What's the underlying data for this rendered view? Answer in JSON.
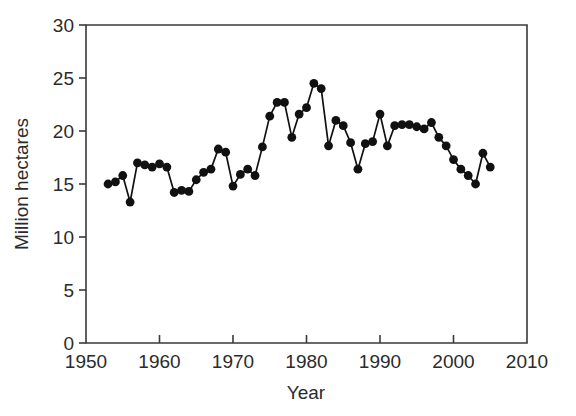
{
  "chart_data": {
    "type": "line",
    "title": "",
    "xlabel": "Year",
    "ylabel": "Million hectares",
    "xlim": [
      1950,
      2010
    ],
    "ylim": [
      0,
      30
    ],
    "xticks": [
      1950,
      1960,
      1970,
      1980,
      1990,
      2000,
      2010
    ],
    "xtick_labels": [
      "1950",
      "1960",
      "1970",
      "1980",
      "1990",
      "2000",
      "2010"
    ],
    "yticks": [
      0,
      5,
      10,
      15,
      20,
      25,
      30
    ],
    "ytick_labels": [
      "0",
      "5",
      "10",
      "15",
      "20",
      "25",
      "30"
    ],
    "grid": false,
    "legend": null,
    "marker": "filled-circle",
    "line_color": "#111111",
    "marker_color": "#111111",
    "axis_color": "#3a3a3a",
    "background": "#ffffff",
    "x": [
      1953,
      1954,
      1955,
      1956,
      1957,
      1958,
      1959,
      1960,
      1961,
      1962,
      1963,
      1964,
      1965,
      1966,
      1967,
      1968,
      1969,
      1970,
      1971,
      1972,
      1973,
      1974,
      1975,
      1976,
      1977,
      1978,
      1979,
      1980,
      1981,
      1982,
      1983,
      1984,
      1985,
      1986,
      1987,
      1988,
      1989,
      1990,
      1991,
      1992,
      1993,
      1994,
      1995,
      1996,
      1997,
      1998,
      1999,
      2000,
      2001,
      2002,
      2003,
      2004
    ],
    "y": [
      15.0,
      15.2,
      15.8,
      13.3,
      17.0,
      16.8,
      16.6,
      16.9,
      16.6,
      14.2,
      14.4,
      14.3,
      15.4,
      16.1,
      16.4,
      18.3,
      18.0,
      14.8,
      15.9,
      16.4,
      15.8,
      18.5,
      21.4,
      22.7,
      22.7,
      19.4,
      21.6,
      22.2,
      24.5,
      24.0,
      18.6,
      21.0,
      20.5,
      18.9,
      16.4,
      18.8,
      19.0,
      21.6,
      18.6,
      20.5,
      20.6,
      20.6,
      20.4,
      20.2,
      20.8,
      19.4,
      18.6,
      17.3,
      16.4,
      15.8,
      15.0,
      17.9,
      16.6
    ],
    "series": [
      {
        "name": "Million hectares",
        "points": [
          [
            1953,
            15.0
          ],
          [
            1954,
            15.2
          ],
          [
            1955,
            15.8
          ],
          [
            1956,
            13.3
          ],
          [
            1957,
            17.0
          ],
          [
            1958,
            16.8
          ],
          [
            1959,
            16.6
          ],
          [
            1960,
            16.9
          ],
          [
            1961,
            16.6
          ],
          [
            1962,
            14.2
          ],
          [
            1963,
            14.4
          ],
          [
            1964,
            14.3
          ],
          [
            1965,
            15.4
          ],
          [
            1966,
            16.1
          ],
          [
            1967,
            16.4
          ],
          [
            1968,
            18.3
          ],
          [
            1969,
            18.0
          ],
          [
            1970,
            14.8
          ],
          [
            1971,
            15.9
          ],
          [
            1972,
            16.4
          ],
          [
            1973,
            15.8
          ],
          [
            1974,
            18.5
          ],
          [
            1975,
            21.4
          ],
          [
            1976,
            22.7
          ],
          [
            1977,
            22.7
          ],
          [
            1978,
            19.4
          ],
          [
            1979,
            21.6
          ],
          [
            1980,
            22.2
          ],
          [
            1981,
            24.5
          ],
          [
            1982,
            24.0
          ],
          [
            1983,
            18.6
          ],
          [
            1984,
            21.0
          ],
          [
            1985,
            20.5
          ],
          [
            1986,
            18.9
          ],
          [
            1987,
            16.4
          ],
          [
            1988,
            18.8
          ],
          [
            1989,
            19.0
          ],
          [
            1990,
            21.6
          ],
          [
            1991,
            18.6
          ],
          [
            1992,
            20.5
          ],
          [
            1993,
            20.6
          ],
          [
            1994,
            20.6
          ],
          [
            1995,
            20.4
          ],
          [
            1996,
            20.2
          ],
          [
            1997,
            20.8
          ],
          [
            1998,
            19.4
          ],
          [
            1999,
            18.6
          ],
          [
            2000,
            17.3
          ],
          [
            2001,
            16.4
          ],
          [
            2002,
            15.8
          ],
          [
            2003,
            15.0
          ],
          [
            2004,
            17.9
          ],
          [
            2005,
            16.6
          ]
        ]
      }
    ]
  }
}
